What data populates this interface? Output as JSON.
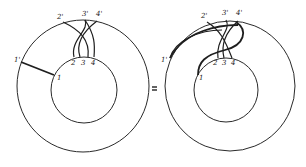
{
  "figure": {
    "relation": "=",
    "left": {
      "inner_labels": [
        "1",
        "2",
        "3",
        "4"
      ],
      "outer_labels": [
        "1'",
        "2'",
        "3'",
        "4'"
      ]
    },
    "right": {
      "inner_labels": [
        "1",
        "2",
        "3",
        "4"
      ],
      "outer_labels": [
        "1'",
        "2'",
        "3'",
        "4'"
      ]
    }
  }
}
